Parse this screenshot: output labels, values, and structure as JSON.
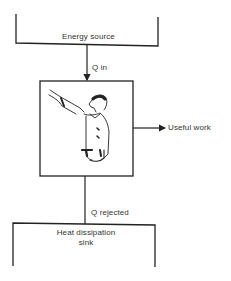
{
  "diagram": {
    "type": "heat-engine-flow",
    "nodes": {
      "source": {
        "label": "Energy source"
      },
      "engine": {
        "label": "",
        "illustration": "man-worker-reaching-icon"
      },
      "sink": {
        "label_line1": "Heat dissipation",
        "label_line2": "sink"
      }
    },
    "edges": {
      "q_in": {
        "label": "Q in"
      },
      "work": {
        "label": "Useful work"
      },
      "q_rejected": {
        "label": "Q rejected"
      }
    },
    "colors": {
      "line": "#222222",
      "background": "#ffffff"
    }
  }
}
